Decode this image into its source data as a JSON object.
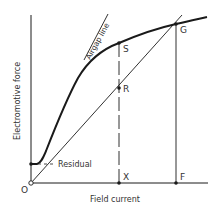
{
  "diagram": {
    "axes": {
      "y_label": "Electromotive force",
      "x_label": "Field current",
      "origin_label": "O"
    },
    "curves": {
      "airgap_line_label": "Airgap line",
      "residual_label": "Residual"
    },
    "points": {
      "S": "S",
      "R": "R",
      "G": "G",
      "X": "X",
      "F": "F"
    },
    "colors": {
      "line": "#1a1a1a",
      "text": "#333333",
      "background": "#ffffff"
    }
  }
}
